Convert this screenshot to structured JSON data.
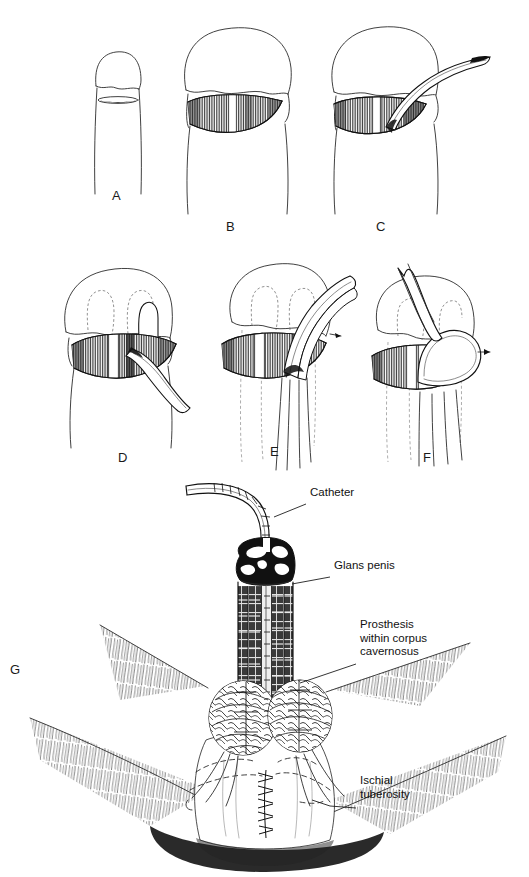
{
  "figure": {
    "type": "medical-surgical-illustration",
    "style": "pen-and-ink line drawing",
    "background_color": "#ffffff",
    "ink_color": "#111111",
    "width": 529,
    "height": 877
  },
  "panels": [
    {
      "id": "A",
      "letter": "A",
      "letter_x": 118,
      "letter_y": 196,
      "caption": "Flaccid penile shaft with planned transverse distal shaft incision marked",
      "contents": [
        "penile-shaft",
        "glans-outline",
        "incision-marking-ellipse"
      ]
    },
    {
      "id": "B",
      "letter": "B",
      "letter_x": 231,
      "letter_y": 226,
      "caption": "Transverse incision opened exposing both corpora cavernosa separated by the midline septum",
      "contents": [
        "glans-outline",
        "lens-shaped-corporotomy",
        "vertical-hatching",
        "midline-septum-highlight"
      ]
    },
    {
      "id": "C",
      "letter": "C",
      "letter_x": 381,
      "letter_y": 226,
      "caption": "Curved dilator/sound passed distally into the right corpus cavernosum",
      "contents": [
        "glans-outline",
        "corporotomy",
        "curved-dilator-instrument"
      ]
    },
    {
      "id": "D",
      "letter": "D",
      "letter_x": 123,
      "letter_y": 458,
      "caption": "Prosthesis rod introduced through corporotomy; dashed lines show dilated distal corporal tunnels",
      "contents": [
        "glans-outline",
        "dashed-corporal-tunnels",
        "corporotomy",
        "prosthesis-rod-distal"
      ]
    },
    {
      "id": "E",
      "letter": "E",
      "letter_x": 274,
      "letter_y": 452,
      "caption": "Proximal end of the prosthesis rod flexed out of the corporotomy before seating",
      "contents": [
        "glans-outline",
        "dashed-corporal-tunnels",
        "corporotomy",
        "prosthesis-rod-flexed",
        "arrow-marker"
      ]
    },
    {
      "id": "F",
      "letter": "F",
      "letter_x": 427,
      "letter_y": 458,
      "caption": "Rod looped and guided proximally into the crus of the corpus cavernosum",
      "contents": [
        "glans-outline",
        "dashed-corporal-tunnels",
        "corporotomy",
        "prosthesis-rod-looped",
        "arrow-marker"
      ]
    },
    {
      "id": "G",
      "letter": "G",
      "letter_x": 14,
      "letter_y": 670,
      "caption": "Completed repair seen from the perineum: prostheses seated within both corpora, urethral catheter in place, perineal closure sutured",
      "contents": [
        "catheter",
        "glans-penis",
        "shaft-with-prostheses",
        "corpora-crura",
        "thigh-skin-hair",
        "perineal-suture-line",
        "ischial-tuberosity-outlines"
      ]
    }
  ],
  "callouts": [
    {
      "id": "catheter",
      "label": "Catheter",
      "text_x": 310,
      "text_y": 493,
      "leader_from_x": 306,
      "leader_from_y": 504,
      "leader_to_x": 274,
      "leader_to_y": 517
    },
    {
      "id": "glans-penis",
      "label": "Glans penis",
      "text_x": 334,
      "text_y": 566,
      "leader_from_x": 330,
      "leader_from_y": 577,
      "leader_to_x": 293,
      "leader_to_y": 584
    },
    {
      "id": "prosthesis-within-corpus-cavernosus",
      "label": "Prosthesis\nwithin corpus\ncavernosus",
      "text_x": 360,
      "text_y": 625,
      "leader_from_x": 356,
      "leader_from_y": 664,
      "leader_to_x": 300,
      "leader_to_y": 683
    },
    {
      "id": "ischial-tuberosity",
      "label": "Ischial\ntuberosity",
      "text_x": 360,
      "text_y": 781,
      "leader_from_x": 356,
      "leader_from_y": 808,
      "leader_to_x": 312,
      "leader_to_y": 802
    }
  ],
  "anatomy_terms": [
    "Catheter",
    "Glans penis",
    "Prosthesis within corpus cavernosus",
    "Ischial tuberosity"
  ]
}
